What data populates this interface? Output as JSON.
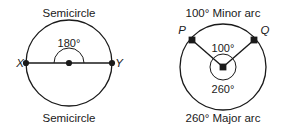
{
  "figure": {
    "stroke_color": "#1a1a1a",
    "background_color": "#ffffff"
  },
  "left_figure": {
    "name": "semicircle-diagram",
    "top_caption": "Semicircle",
    "bottom_caption": "Semicircle",
    "central_angle": "180°",
    "point_labels": {
      "left": "X",
      "right": "Y"
    }
  },
  "right_figure": {
    "name": "minor-major-arc-diagram",
    "top_caption": "100° Minor arc",
    "bottom_caption": "260° Major arc",
    "central_angle": "100°",
    "reflex_angle": "260°",
    "point_labels": {
      "left": "P",
      "right": "Q"
    }
  }
}
